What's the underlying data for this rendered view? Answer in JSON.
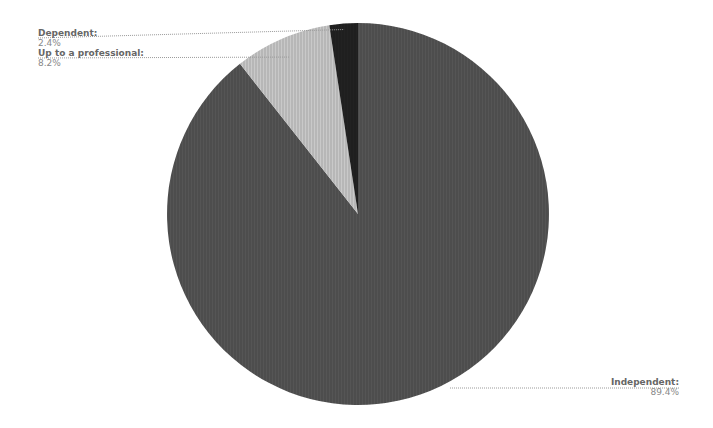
{
  "chart_data": {
    "type": "pie",
    "title": "",
    "categories": [
      "Independent",
      "Up to a professional",
      "Dependent"
    ],
    "values": [
      89.4,
      8.2,
      2.4
    ],
    "unit": "%",
    "colors": [
      "#555555",
      "#c9c9c9",
      "#222222"
    ],
    "labels": [
      {
        "name": "Independent:",
        "value": "89.4%"
      },
      {
        "name": "Up to a professional:",
        "value": "8.2%"
      },
      {
        "name": "Dependent:",
        "value": "2.4%"
      }
    ],
    "start_angle_deg": 0,
    "direction": "clockwise",
    "legend": "none",
    "center": [
      358,
      214
    ],
    "radius": 191
  }
}
